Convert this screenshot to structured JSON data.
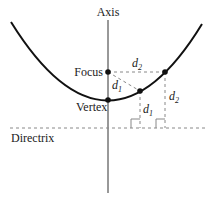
{
  "diagram": {
    "labels": {
      "axis": "Axis",
      "focus": "Focus",
      "vertex": "Vertex",
      "directrix": "Directrix",
      "d1_var": "d",
      "d1_sub": "1",
      "d2_var": "d",
      "d2_sub": "2"
    },
    "colors": {
      "curve": "#111111",
      "axis": "#333333",
      "dashed": "#888888",
      "text": "#222222"
    },
    "points": {
      "focus": [
        108,
        72
      ],
      "vertex": [
        108,
        100
      ],
      "p1": [
        140,
        91
      ],
      "p2": [
        165,
        72
      ]
    },
    "directrix_y": 128
  }
}
